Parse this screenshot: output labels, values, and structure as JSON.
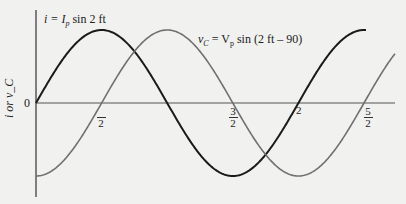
{
  "chart_data": {
    "type": "line",
    "title": "",
    "xlabel": "",
    "ylabel": "i or v_C",
    "origin_label": "0",
    "x_ticks": [
      {
        "value": "π/2",
        "num": "",
        "den": "2"
      },
      {
        "value": "3π/2",
        "num": "3",
        "den": "2"
      },
      {
        "value": "2π",
        "num": "",
        "den": "2",
        "inline": true
      },
      {
        "value": "5π/2",
        "num": "5",
        "den": "2"
      }
    ],
    "x_range_radians": [
      0,
      7.85
    ],
    "series": [
      {
        "name": "i = I_p sin 2πft",
        "label": "i = I",
        "label_sub": "p",
        "label_rest": " sin 2  ft",
        "color": "#1a1a1a",
        "phase_deg": 0,
        "amplitude": 1
      },
      {
        "name": "v_C = V_p sin (2πft − 90)",
        "label": "v",
        "label_sub": "C",
        "label_rest2": " = V",
        "label_sub2": "p",
        "label_rest": " sin (2  ft – 90)",
        "color": "#6a6a6a",
        "phase_deg": -90,
        "amplitude": 1
      }
    ],
    "grid": false,
    "legend": "inline annotations"
  }
}
